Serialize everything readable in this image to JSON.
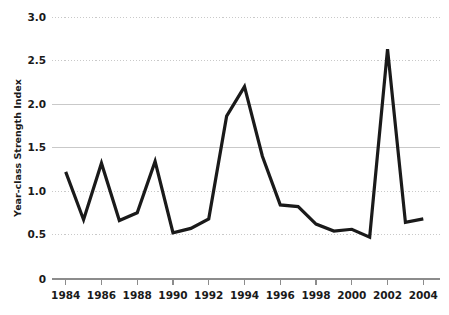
{
  "chart_data": {
    "type": "line",
    "title": "",
    "subtitle": "",
    "xlabel": "",
    "ylabel": "Year-class Strength Index",
    "x": [
      1984,
      1985,
      1986,
      1987,
      1988,
      1989,
      1990,
      1991,
      1992,
      1993,
      1994,
      1995,
      1996,
      1997,
      1998,
      1999,
      2000,
      2001,
      2002,
      2003,
      2004
    ],
    "values": [
      1.22,
      0.67,
      1.32,
      0.66,
      0.75,
      1.34,
      0.52,
      0.57,
      0.68,
      1.86,
      2.2,
      1.4,
      0.84,
      0.82,
      0.62,
      0.54,
      0.56,
      0.47,
      2.63,
      0.64,
      0.68
    ],
    "series": [
      {
        "name": "Year-class Strength Index",
        "values": [
          1.22,
          0.67,
          1.32,
          0.66,
          0.75,
          1.34,
          0.52,
          0.57,
          0.68,
          1.86,
          2.2,
          1.4,
          0.84,
          0.82,
          0.62,
          0.54,
          0.56,
          0.47,
          2.63,
          0.64,
          0.68
        ]
      }
    ],
    "xlim": [
      1984,
      2004
    ],
    "ylim": [
      0.5,
      3.0
    ],
    "y_ticks": [
      "0.5",
      "1.0",
      "1.5",
      "2.0",
      "2.5",
      "3.0"
    ],
    "y_tick_values": [
      0.5,
      1.0,
      1.5,
      2.0,
      2.5,
      3.0
    ],
    "y_zero_label": "0",
    "y_axis_broken": true,
    "x_ticks": [
      "1984",
      "1986",
      "1988",
      "1990",
      "1992",
      "1994",
      "1996",
      "1998",
      "2000",
      "2002",
      "2004"
    ],
    "x_tick_values": [
      1984,
      1986,
      1988,
      1990,
      1992,
      1994,
      1996,
      1998,
      2000,
      2002,
      2004
    ],
    "grid": true,
    "grid_axis": "y",
    "legend": false,
    "legend_position": "none",
    "line_color": "#1a1a1a",
    "line_width": 3.2,
    "grid_color": "#c9c9c9",
    "axis_color": "#8c8c8c",
    "background_color": "#ffffff"
  }
}
